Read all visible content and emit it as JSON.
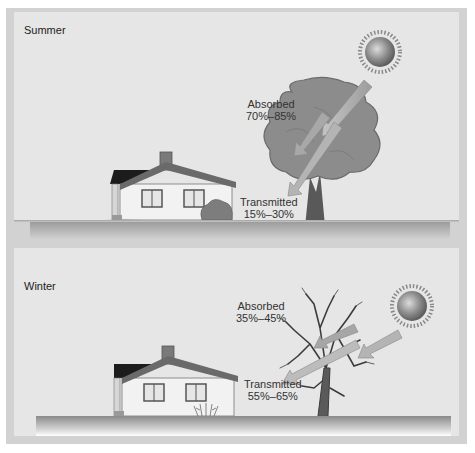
{
  "figure": {
    "panels": [
      {
        "season": "Summer",
        "tree_state": "full-foliage",
        "absorbed": {
          "label": "Absorbed",
          "range": "70%–85%"
        },
        "transmitted": {
          "label": "Transmitted",
          "range": "15%–30%"
        }
      },
      {
        "season": "Winter",
        "tree_state": "bare-branches",
        "absorbed": {
          "label": "Absorbed",
          "range": "35%–45%"
        },
        "transmitted": {
          "label": "Transmitted",
          "range": "55%–65%"
        }
      }
    ],
    "icons": [
      "sun-icon",
      "tree-icon",
      "house-icon",
      "sunlight-arrow-icon",
      "shrub-icon"
    ],
    "colors": {
      "background": "#e6e6e6",
      "frame": "#d2d2d2",
      "foliage": "#8a8a8a",
      "trunk": "#555555",
      "arrow": "#b0b0b0",
      "house_wall": "#f2f2f2",
      "roof_line": "#666666"
    }
  }
}
